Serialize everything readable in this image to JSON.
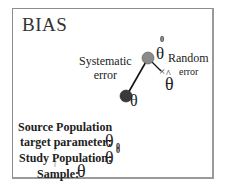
{
  "diagram": {
    "title": "BIAS",
    "labels": {
      "systematic_error_line1": "Systematic",
      "systematic_error_line2": "error",
      "random_error_line1": "Random",
      "random_error_line2": "error",
      "theta": "θ",
      "theta_hat": "θ",
      "hat": "^",
      "superscript_zero": "0",
      "subscript_zero": "0",
      "x_mark": "×"
    },
    "nodes": [
      {
        "id": "true-parameter",
        "symbol": "θ",
        "color": "#3a3a3a"
      },
      {
        "id": "study-parameter",
        "symbol": "θ⁰",
        "color": "#8a8a8a"
      },
      {
        "id": "sample-estimate",
        "symbol": "θ̂",
        "marker": "×"
      }
    ],
    "legend": {
      "source_population": "Source Population",
      "target_parameter": "target parameter",
      "study_population": "Study Population",
      "sample": "Sample",
      "colon": ":"
    },
    "colors": {
      "dark_node": "#3a3a3a",
      "gray_node": "#8a8a8a",
      "frame": "#8c8c8c",
      "text": "#222222"
    }
  }
}
